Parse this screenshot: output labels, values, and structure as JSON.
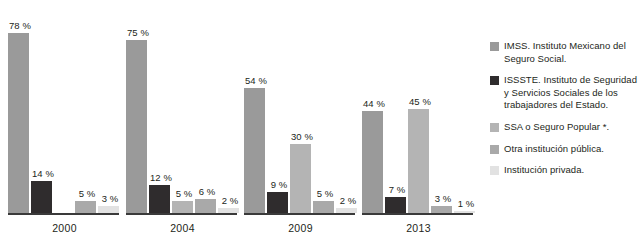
{
  "chart_data": {
    "type": "bar",
    "title": "",
    "subtitle": "",
    "xlabel": "",
    "ylabel": "",
    "ylim": [
      0,
      80
    ],
    "grid": false,
    "legend_position": "right",
    "categories": [
      "2000",
      "2004",
      "2009",
      "2013"
    ],
    "series": [
      {
        "name": "IMSS. Instituto Mexicano del Seguro Social.",
        "color": "#9a9a9a",
        "values": [
          78,
          75,
          54,
          44
        ],
        "labels": [
          "78 %",
          "75 %",
          "54 %",
          "44 %"
        ]
      },
      {
        "name": "ISSSTE. Instituto de Seguridad y Servicios Sociales de los trabajadores del Estado.",
        "color": "#2f2c2d",
        "values": [
          14,
          12,
          9,
          7
        ],
        "labels": [
          "14 %",
          "12 %",
          "9 %",
          "7 %"
        ]
      },
      {
        "name": "SSA o Seguro Popular *.",
        "color": "#b4b4b4",
        "values": [
          null,
          5,
          30,
          45
        ],
        "labels": [
          "",
          "5 %",
          "30 %",
          "45 %"
        ]
      },
      {
        "name": "Otra institución pública.",
        "color": "#a9a9a9",
        "values": [
          5,
          6,
          5,
          3
        ],
        "labels": [
          "5 %",
          "6 %",
          "5 %",
          "3 %"
        ]
      },
      {
        "name": "Institución privada.",
        "color": "#e2e2e2",
        "values": [
          3,
          2,
          2,
          1
        ],
        "labels": [
          "3 %",
          "2 %",
          "2 %",
          "1 %"
        ]
      }
    ]
  },
  "axis": {
    "ticks": [
      "2000",
      "2004",
      "2009",
      "2013"
    ]
  },
  "legend": {
    "items": [
      {
        "label": "IMSS. Instituto Mexicano del Seguro Social.",
        "color": "#9a9a9a"
      },
      {
        "label": "ISSSTE. Instituto de Seguridad y Servicios Sociales de los trabajadores del Estado.",
        "color": "#2f2c2d"
      },
      {
        "label": "SSA o Seguro Popular *.",
        "color": "#b4b4b4"
      },
      {
        "label": "Otra institución pública.",
        "color": "#a9a9a9"
      },
      {
        "label": "Institución privada.",
        "color": "#e2e2e2"
      }
    ]
  }
}
